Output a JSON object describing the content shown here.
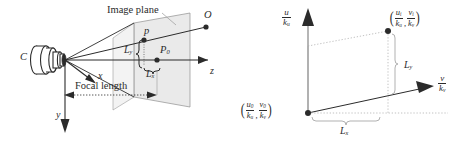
{
  "figure": {
    "background_color": "#ffffff",
    "ink_color": "#2b2b2b",
    "plane_fill_color": "#d9d9d9",
    "guide_color": "#a8a8a8"
  },
  "left_panel": {
    "name": "pinhole-camera-projection",
    "labels": {
      "camera_center": "C",
      "image_plane": "Image plane",
      "focal_length": "Focal length",
      "axis_x": "x",
      "axis_y": "y",
      "axis_z": "z",
      "point_object": "O",
      "point_image": "p",
      "point_principal_main": "P",
      "point_principal_sub": "0",
      "length_y_main": "L",
      "length_y_sub": "y",
      "length_x_main": "L",
      "length_x_sub": "x"
    }
  },
  "right_panel": {
    "name": "image-plane-coordinates",
    "labels": {
      "axis_u_num": "u",
      "axis_u_den_main": "k",
      "axis_u_den_sub": "u",
      "axis_v_num": "v",
      "axis_v_den_main": "k",
      "axis_v_den_sub": "v",
      "point_i_u_num_main": "u",
      "point_i_u_num_sub": "i",
      "point_i_u_den_main": "k",
      "point_i_u_den_sub": "u",
      "point_i_v_num_main": "v",
      "point_i_v_num_sub": "i",
      "point_i_v_den_main": "k",
      "point_i_v_den_sub": "v",
      "point_0_u_num_main": "u",
      "point_0_u_num_sub": "0",
      "point_0_u_den_main": "k",
      "point_0_u_den_sub": "u",
      "point_0_v_num_main": "v",
      "point_0_v_num_sub": "0",
      "point_0_v_den_main": "k",
      "point_0_v_den_sub": "v",
      "length_y_main": "L",
      "length_y_sub": "y",
      "length_x_main": "L",
      "length_x_sub": "x",
      "comma": ","
    }
  }
}
